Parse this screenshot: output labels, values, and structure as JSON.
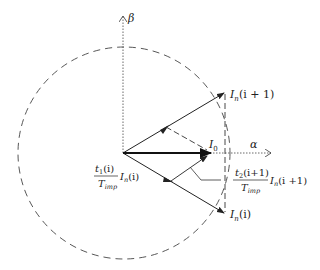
{
  "diagram": {
    "type": "space-vector-diagram",
    "axes": {
      "alpha_label": "α",
      "beta_label": "β"
    },
    "vectors": {
      "next": {
        "label_main": "I",
        "label_sub": "n",
        "label_arg": "(i + 1)"
      },
      "current": {
        "label_main": "I",
        "label_sub": "n",
        "label_arg": "(i)"
      },
      "reference": {
        "label_main": "I",
        "label_sub": "0"
      }
    },
    "annotations": {
      "left_fraction": {
        "numerator_main": "t",
        "numerator_sub": "1",
        "numerator_arg": "(i)",
        "denominator_main": "T",
        "denominator_sub": "imp",
        "factor_main": "I",
        "factor_sub": "n",
        "factor_arg": "(i)"
      },
      "right_fraction": {
        "numerator_main": "t",
        "numerator_sub": "2",
        "numerator_arg": "(i+1)",
        "denominator_main": "T",
        "denominator_sub": "imp",
        "factor_main": "I",
        "factor_sub": "n",
        "factor_arg": "(i +1)"
      }
    },
    "colors": {
      "stroke": "#222222",
      "background": "#ffffff"
    }
  }
}
